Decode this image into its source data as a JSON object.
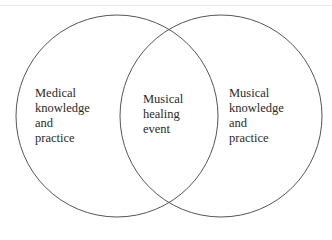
{
  "diagram": {
    "type": "venn",
    "circles": [
      {
        "name": "medical",
        "lines": [
          "Medical",
          "knowledge",
          "and",
          "practice"
        ]
      },
      {
        "name": "musical",
        "lines": [
          "Musical",
          "knowledge",
          "and",
          "practice"
        ]
      }
    ],
    "intersection": {
      "lines": [
        "Musical",
        "healing",
        "event"
      ]
    },
    "stroke_color": "#555555"
  }
}
